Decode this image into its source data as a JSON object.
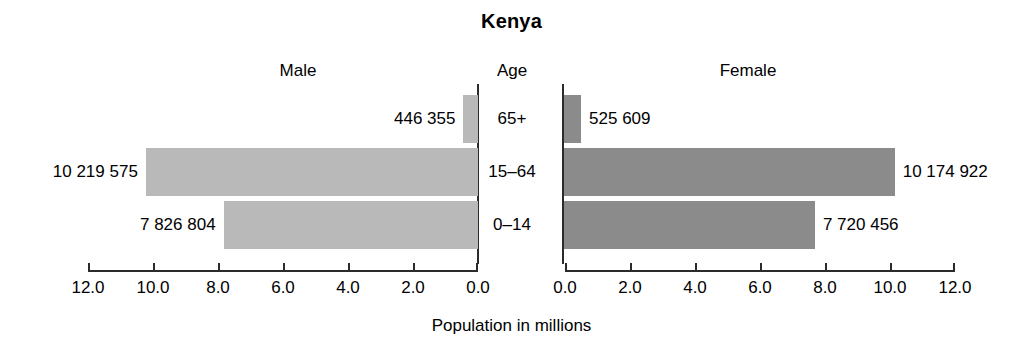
{
  "chart_data": {
    "type": "bar",
    "subtype": "population-pyramid",
    "title": "Kenya",
    "xlabel": "Population in millions",
    "ylabel": "Age",
    "grid": false,
    "legend": "none",
    "orientation": "horizontal",
    "axis_unit_millions": true,
    "categories": [
      "65+",
      "15–64",
      "0–14"
    ],
    "xlim_left": [
      12.0,
      0.0
    ],
    "xlim_right": [
      0.0,
      12.0
    ],
    "ticks_left": [
      "12.0",
      "10.0",
      "8.0",
      "6.0",
      "4.0",
      "2.0",
      "0.0"
    ],
    "ticks_right": [
      "0.0",
      "2.0",
      "4.0",
      "6.0",
      "8.0",
      "10.0",
      "12.0"
    ],
    "tick_values": [
      12.0,
      10.0,
      8.0,
      6.0,
      4.0,
      2.0,
      0.0
    ],
    "series": [
      {
        "name": "Male",
        "color": "#b9b9b9",
        "values": [
          446355,
          10219575,
          7826804
        ],
        "values_millions": [
          0.446355,
          10.219575,
          7.826804
        ],
        "labels": [
          "446 355",
          "10 219 575",
          "7 826 804"
        ]
      },
      {
        "name": "Female",
        "color": "#8b8b8b",
        "values": [
          525609,
          10174922,
          7720456
        ],
        "values_millions": [
          0.525609,
          10.174922,
          7.720456
        ],
        "labels": [
          "525 609",
          "10 174 922",
          "7 720 456"
        ]
      }
    ]
  },
  "headers": {
    "male": "Male",
    "age": "Age",
    "female": "Female"
  },
  "colors": {
    "male_bar": "#b9b9b9",
    "female_bar": "#8b8b8b",
    "axis": "#2b2b2b",
    "text": "#000000",
    "background": "#ffffff"
  }
}
